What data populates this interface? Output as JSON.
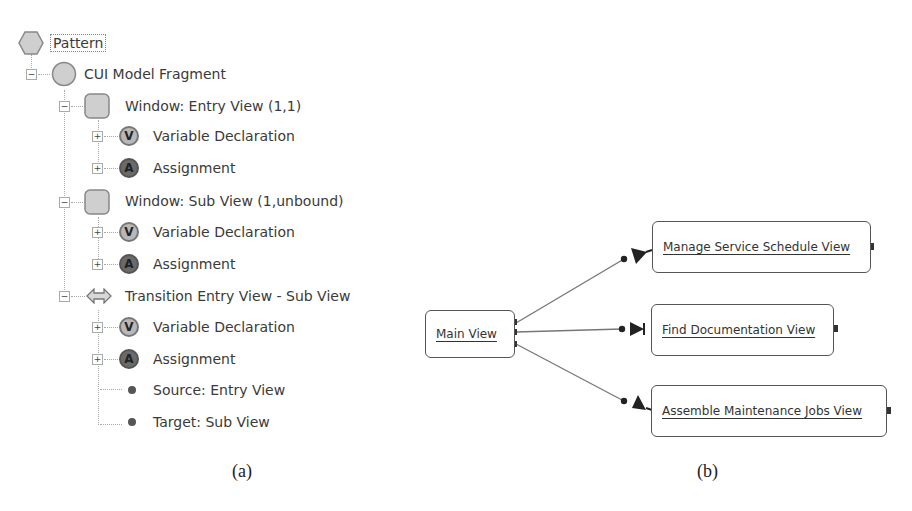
{
  "panel_a": {
    "tree": {
      "root": {
        "label": "Pattern",
        "icon": "hexagon-icon"
      },
      "fragment": {
        "label": "CUI Model Fragment",
        "icon": "circle-icon",
        "expander": "−"
      },
      "window_entry": {
        "label": "Window: Entry View (1,1)",
        "icon": "square-icon",
        "expander": "−",
        "children": [
          {
            "label": "Variable Declaration",
            "badge": "V",
            "expander": "+"
          },
          {
            "label": "Assignment",
            "badge": "A",
            "expander": "+"
          }
        ]
      },
      "window_sub": {
        "label": "Window: Sub View (1,unbound)",
        "icon": "square-icon",
        "expander": "−",
        "children": [
          {
            "label": "Variable Declaration",
            "badge": "V",
            "expander": "+"
          },
          {
            "label": "Assignment",
            "badge": "A",
            "expander": "+"
          }
        ]
      },
      "transition": {
        "label": "Transition Entry View - Sub View",
        "icon": "double-arrow-icon",
        "expander": "−",
        "children": [
          {
            "label": "Variable Declaration",
            "badge": "V",
            "expander": "+"
          },
          {
            "label": "Assignment",
            "badge": "A",
            "expander": "+"
          },
          {
            "label": "Source: Entry View"
          },
          {
            "label": "Target: Sub View"
          }
        ]
      }
    },
    "caption": "(a)"
  },
  "panel_b": {
    "nodes": {
      "main": "Main View",
      "manage": "Manage Service Schedule View",
      "find": "Find Documentation View",
      "assemble": "Assemble Maintenance Jobs View"
    },
    "caption": "(b)"
  }
}
